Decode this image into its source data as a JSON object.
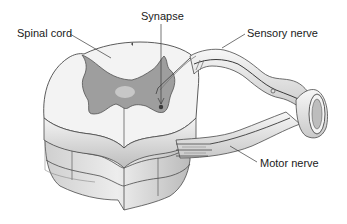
{
  "diagram": {
    "labels": {
      "spinal_cord": "Spinal cord",
      "synapse": "Synapse",
      "sensory_nerve": "Sensory nerve",
      "motor_nerve": "Motor nerve"
    },
    "colors": {
      "white_matter": "#f2f2f2",
      "gray_matter": "#9a9a9a",
      "outline": "#4a4a4a",
      "nerve": "#e6e6e6",
      "text": "#1a1a1a"
    }
  }
}
